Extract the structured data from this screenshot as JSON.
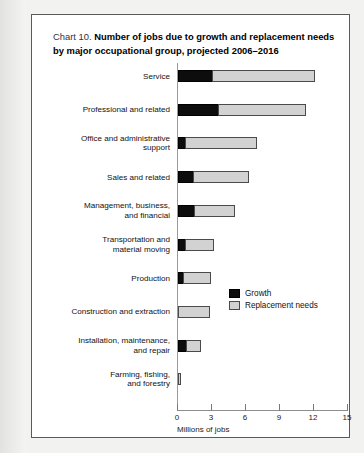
{
  "document": {
    "background_color": "#f2f2f0",
    "card_background": "#ffffff"
  },
  "title": {
    "prefix": "Chart 10.",
    "main": "Number of jobs due to growth and replacement needs by major occupational group, projected 2006–2016"
  },
  "legend": {
    "position": "inside-right-middle",
    "items": [
      {
        "label": "Growth",
        "color": "#0d0d0d",
        "icon": "legend-swatch-growth"
      },
      {
        "label": "Replacement needs",
        "color": "#d2d2d2",
        "icon": "legend-swatch-replacement"
      }
    ]
  },
  "chart_data": {
    "type": "bar",
    "orientation": "horizontal",
    "stacked": true,
    "title": "Chart 10. Number of jobs due to growth and replacement needs by major occupational group, projected 2006–2016",
    "xlabel": "Millions of jobs",
    "ylabel": "",
    "xlim": [
      0,
      15
    ],
    "xticks": [
      0,
      3,
      6,
      9,
      12,
      15
    ],
    "xtick_labels": [
      "0",
      "3",
      "6",
      "9",
      "12",
      "15"
    ],
    "grid": false,
    "legend_position": "center-right",
    "categories": [
      "Service",
      "Professional and related",
      "Office and administrative support",
      "Sales and related",
      "Management, business, and financial",
      "Transportation and material moving",
      "Production",
      "Construction and extraction",
      "Installation, maintenance, and repair",
      "Farming, fishing, and forestry"
    ],
    "category_label_lines": [
      [
        "Service"
      ],
      [
        "Professional and related"
      ],
      [
        "Office and administrative",
        "support"
      ],
      [
        "Sales and related"
      ],
      [
        "Management, business,",
        "and financial"
      ],
      [
        "Transportation and",
        "material moving"
      ],
      [
        "Production"
      ],
      [
        "Construction and extraction"
      ],
      [
        "Installation, maintenance,",
        "and repair"
      ],
      [
        "Farming, fishing,",
        "and forestry"
      ]
    ],
    "series": [
      {
        "name": "Growth",
        "color": "#0d0d0d",
        "values": [
          3.0,
          3.5,
          0.6,
          1.3,
          1.4,
          0.6,
          0.4,
          0.0,
          0.7,
          0.0
        ]
      },
      {
        "name": "Replacement needs",
        "color": "#d2d2d2",
        "values": [
          9.1,
          7.8,
          6.4,
          5.0,
          3.6,
          2.6,
          2.5,
          2.8,
          1.3,
          0.3
        ]
      }
    ],
    "totals": [
      12.1,
      11.3,
      7.0,
      6.3,
      5.0,
      3.2,
      2.9,
      2.8,
      2.0,
      0.3
    ]
  }
}
